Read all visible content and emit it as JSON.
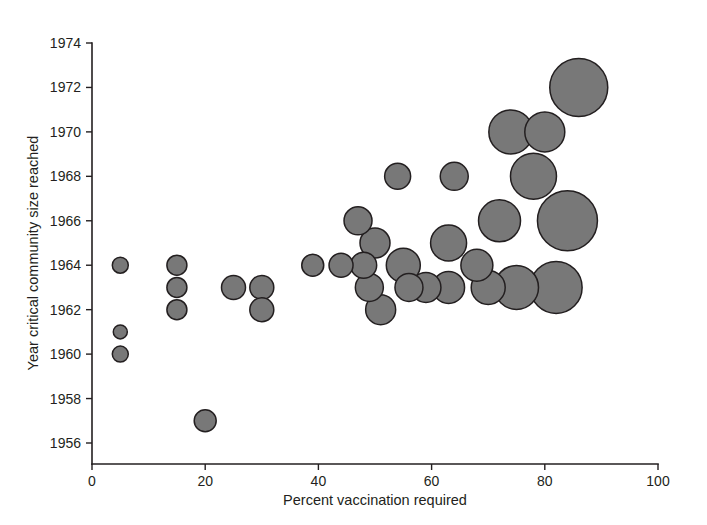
{
  "chart_data": {
    "type": "scatter",
    "title": "",
    "xlabel": "Percent vaccination required",
    "ylabel": "Year critical community size reached",
    "xlim": [
      0,
      100
    ],
    "ylim": [
      1955,
      1975
    ],
    "xticks": [
      0,
      20,
      40,
      60,
      80,
      100
    ],
    "xtick_labels": [
      "0",
      "20",
      "40",
      "60",
      "80",
      "100"
    ],
    "yticks": [
      1956,
      1958,
      1960,
      1962,
      1964,
      1966,
      1968,
      1970,
      1972,
      1974
    ],
    "ytick_labels": [
      "1956",
      "1958",
      "1960",
      "1962",
      "1964",
      "1966",
      "1968",
      "1970",
      "1972",
      "1974"
    ],
    "grid": false,
    "legend": false,
    "marker_shape": "circle",
    "marker_fill": "#787878",
    "marker_stroke": "#231f20",
    "size_encodes": "population",
    "points": [
      {
        "x": 5,
        "y": 1964,
        "r": 8
      },
      {
        "x": 5,
        "y": 1961,
        "r": 7
      },
      {
        "x": 5,
        "y": 1960,
        "r": 8
      },
      {
        "x": 15,
        "y": 1964,
        "r": 10
      },
      {
        "x": 15,
        "y": 1963,
        "r": 10
      },
      {
        "x": 15,
        "y": 1962,
        "r": 10
      },
      {
        "x": 20,
        "y": 1957,
        "r": 11
      },
      {
        "x": 25,
        "y": 1963,
        "r": 12
      },
      {
        "x": 30,
        "y": 1963,
        "r": 12
      },
      {
        "x": 30,
        "y": 1962,
        "r": 12
      },
      {
        "x": 39,
        "y": 1964,
        "r": 11
      },
      {
        "x": 44,
        "y": 1964,
        "r": 12
      },
      {
        "x": 47,
        "y": 1966,
        "r": 14
      },
      {
        "x": 48,
        "y": 1964,
        "r": 13
      },
      {
        "x": 49,
        "y": 1963,
        "r": 14
      },
      {
        "x": 50,
        "y": 1965,
        "r": 15
      },
      {
        "x": 51,
        "y": 1962,
        "r": 15
      },
      {
        "x": 54,
        "y": 1968,
        "r": 13
      },
      {
        "x": 55,
        "y": 1964,
        "r": 17
      },
      {
        "x": 56,
        "y": 1963,
        "r": 14
      },
      {
        "x": 59,
        "y": 1963,
        "r": 15
      },
      {
        "x": 64,
        "y": 1968,
        "r": 14
      },
      {
        "x": 63,
        "y": 1965,
        "r": 18
      },
      {
        "x": 63,
        "y": 1963,
        "r": 16
      },
      {
        "x": 68,
        "y": 1964,
        "r": 16
      },
      {
        "x": 70,
        "y": 1963,
        "r": 17
      },
      {
        "x": 72,
        "y": 1966,
        "r": 21
      },
      {
        "x": 74,
        "y": 1970,
        "r": 22
      },
      {
        "x": 75,
        "y": 1963,
        "r": 22
      },
      {
        "x": 78,
        "y": 1968,
        "r": 23
      },
      {
        "x": 80,
        "y": 1970,
        "r": 20
      },
      {
        "x": 86,
        "y": 1972,
        "r": 29
      },
      {
        "x": 84,
        "y": 1966,
        "r": 30
      },
      {
        "x": 82,
        "y": 1963,
        "r": 26
      }
    ]
  },
  "geometry": {
    "plot_left": 92,
    "plot_right": 658,
    "plot_bottom": 464,
    "plot_top": 43,
    "y_at_1956": 443,
    "y_at_1974": 43
  }
}
